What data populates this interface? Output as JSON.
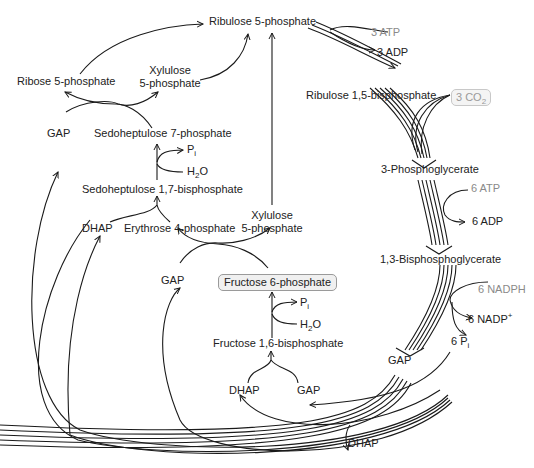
{
  "diagram": {
    "nodes": {
      "ribulose5p": "Ribulose 5-phosphate",
      "ribulose15bp": "Ribulose 1,5-bisphosphate",
      "pga3": "3-Phosphoglycerate",
      "bpg13": "1,3-Bisphosphoglycerate",
      "gap_main": "GAP",
      "dhap_out": "DHAP",
      "ribose5p": "Ribose 5-phosphate",
      "xylulose5p_top_1": "Xylulose",
      "xylulose5p_top_2": "5-phosphate",
      "gap_left": "GAP",
      "sedo7p": "Sedoheptulose 7-phosphate",
      "sedo17bp": "Sedoheptulose 1,7-bisphosphate",
      "dhap_left": "DHAP",
      "erythrose4p": "Erythrose 4-phosphate",
      "xylulose5p_mid_1": "Xylulose",
      "xylulose5p_mid_2": "5-phosphate",
      "gap_mid": "GAP",
      "fructose6p": "Fructose 6-phosphate",
      "fructose16bp": "Fructose 1,6-bisphosphate",
      "dhap_bottom": "DHAP",
      "gap_bottom": "GAP"
    },
    "cofactors": {
      "atp3": "3 ATP",
      "adp3": "3 ADP",
      "co2_num": "3 CO",
      "co2_sub": "2",
      "atp6": "6 ATP",
      "adp6": "6 ADP",
      "nadph6": "6 NADPH",
      "nadp6": "6 NADP",
      "nadp6_sup": "+",
      "pi6": "6 P",
      "pi6_sub": "i",
      "pi_a": "P",
      "pi_a_sub": "i",
      "h2o_a_1": "H",
      "h2o_a_sub": "2",
      "h2o_a_2": "O",
      "pi_b": "P",
      "pi_b_sub": "i",
      "h2o_b_1": "H",
      "h2o_b_sub": "2",
      "h2o_b_2": "O"
    },
    "colors": {
      "line": "#1a1a1a",
      "grey_text": "#8a8a8a",
      "box_fill": "#f0f0f0"
    }
  }
}
